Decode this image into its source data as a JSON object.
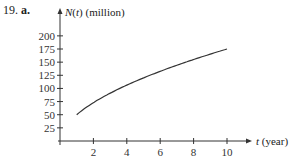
{
  "problem": {
    "number": "19.",
    "part": "a."
  },
  "chart_data": {
    "type": "line",
    "title": "",
    "xlabel": "t (year)",
    "ylabel": "N(t) (million)",
    "x_ticks": [
      2,
      4,
      6,
      8,
      10
    ],
    "y_ticks": [
      25,
      50,
      75,
      100,
      125,
      150,
      175,
      200
    ],
    "xlim": [
      0,
      11
    ],
    "ylim": [
      0,
      210
    ],
    "grid": false,
    "series": [
      {
        "name": "N(t)",
        "x": [
          1,
          2,
          3,
          4,
          5,
          6,
          7,
          8,
          9,
          10
        ],
        "values": [
          50,
          71,
          88,
          102,
          115,
          126,
          137,
          147,
          156,
          175
        ]
      }
    ]
  },
  "axis": {
    "y_label_main": "N",
    "y_label_var": "t",
    "y_label_unit": "(million)",
    "x_label_var": "t",
    "x_label_unit": "(year)"
  }
}
